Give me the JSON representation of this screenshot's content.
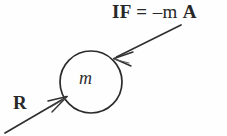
{
  "figure": {
    "background_color": "#fefefe",
    "ink_color": "#272727",
    "labels": {
      "inertial_force": {
        "prefix": "IF = ",
        "minus_m": "–m ",
        "accel": "A",
        "full_text": "IF = –m A"
      },
      "reaction": "R",
      "mass": "m"
    },
    "body": {
      "shape": "circle",
      "center_x": 91,
      "center_y": 82,
      "radius": 31,
      "stroke_color": "#2b2b2b",
      "stroke_width": 1.6,
      "fill": "none",
      "inner_label": "m"
    },
    "arrows": [
      {
        "name": "inertial-force-arrow",
        "label": "IF = –m A",
        "tail_x": 181,
        "tail_y": 25,
        "tip_x": 114,
        "tip_y": 58,
        "direction": "down-left",
        "points_to": "upper-right of mass circle"
      },
      {
        "name": "reaction-arrow",
        "label": "R",
        "tail_x": 5,
        "tail_y": 133,
        "tip_x": 67,
        "tip_y": 97,
        "direction": "up-right",
        "points_to": "lower-left of mass circle"
      }
    ]
  }
}
